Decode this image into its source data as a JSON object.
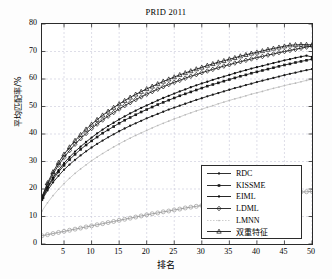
{
  "chart_data": {
    "type": "line",
    "title": "PRID 2011",
    "xlabel": "排名",
    "ylabel": "平均匹配率/%",
    "xlim": [
      1,
      50
    ],
    "ylim": [
      0,
      80
    ],
    "xticks": [
      5,
      10,
      15,
      20,
      25,
      30,
      35,
      40,
      45,
      50
    ],
    "yticks": [
      0,
      10,
      20,
      30,
      40,
      50,
      60,
      70,
      80
    ],
    "grid": true,
    "legend_position": "lower right",
    "x": [
      1,
      2,
      3,
      4,
      5,
      6,
      7,
      8,
      9,
      10,
      11,
      12,
      13,
      14,
      15,
      16,
      17,
      18,
      19,
      20,
      21,
      22,
      23,
      24,
      25,
      26,
      27,
      28,
      29,
      30,
      31,
      32,
      33,
      34,
      35,
      36,
      37,
      38,
      39,
      40,
      41,
      42,
      43,
      44,
      45,
      46,
      47,
      48,
      49,
      50
    ],
    "series": [
      {
        "name": "RDC",
        "marker": "dot",
        "color": "#1a1a1a",
        "values": [
          16.0,
          19.5,
          22.4,
          24.8,
          27.0,
          28.9,
          30.6,
          32.2,
          33.7,
          35.1,
          36.4,
          37.6,
          38.8,
          39.9,
          41.0,
          42.0,
          43.0,
          43.9,
          44.8,
          45.7,
          46.5,
          47.3,
          48.1,
          48.9,
          49.6,
          50.3,
          51.0,
          51.7,
          52.4,
          53.0,
          53.7,
          54.3,
          54.9,
          55.5,
          56.1,
          56.7,
          57.2,
          57.8,
          58.3,
          58.9,
          59.4,
          59.9,
          60.4,
          60.9,
          61.4,
          61.9,
          62.3,
          62.8,
          63.2,
          63.6
        ]
      },
      {
        "name": "KISSME",
        "marker": "square",
        "color": "#1a1a1a",
        "values": [
          16.3,
          20.3,
          23.5,
          26.2,
          28.6,
          30.7,
          32.6,
          34.4,
          36.0,
          37.5,
          38.9,
          40.3,
          41.5,
          42.7,
          43.9,
          45.0,
          46.0,
          47.0,
          48.0,
          48.9,
          49.8,
          50.7,
          51.5,
          52.3,
          53.1,
          53.9,
          54.6,
          55.3,
          56.0,
          56.7,
          57.4,
          58.0,
          58.6,
          59.2,
          59.8,
          60.4,
          61.0,
          61.5,
          62.1,
          62.6,
          63.1,
          63.6,
          64.1,
          64.6,
          65.1,
          65.5,
          66.0,
          66.4,
          66.8,
          67.2
        ]
      },
      {
        "name": "EIML",
        "marker": "dot-filled",
        "color": "#0d0d0d",
        "values": [
          16.6,
          20.8,
          24.1,
          26.9,
          29.4,
          31.6,
          33.6,
          35.4,
          37.1,
          38.7,
          40.2,
          41.6,
          42.9,
          44.1,
          45.3,
          46.4,
          47.5,
          48.5,
          49.5,
          50.4,
          51.3,
          52.2,
          53.1,
          53.9,
          54.7,
          55.5,
          56.2,
          57.0,
          57.7,
          58.4,
          59.0,
          59.7,
          60.3,
          60.9,
          61.5,
          62.1,
          62.7,
          63.2,
          63.8,
          64.3,
          64.8,
          65.3,
          65.8,
          66.3,
          66.8,
          67.2,
          67.7,
          68.1,
          68.5,
          68.0
        ]
      },
      {
        "name": "LDML",
        "marker": "diamond",
        "color": "#1a1a1a",
        "values": [
          16.8,
          21.6,
          25.4,
          28.7,
          31.5,
          34.0,
          36.3,
          38.3,
          40.2,
          42.0,
          43.6,
          45.1,
          46.5,
          47.8,
          49.1,
          50.3,
          51.4,
          52.5,
          53.5,
          54.5,
          55.4,
          56.3,
          57.2,
          58.0,
          58.8,
          59.5,
          60.3,
          61.0,
          61.6,
          62.3,
          62.9,
          63.5,
          64.1,
          64.7,
          65.2,
          65.8,
          66.3,
          66.8,
          67.3,
          67.8,
          68.2,
          68.7,
          69.1,
          69.6,
          70.0,
          70.4,
          70.8,
          71.2,
          71.6,
          72.0
        ]
      },
      {
        "name": "LMNN",
        "marker": "dot-light",
        "color": "#b9b9b9",
        "values": [
          12.0,
          15.0,
          17.6,
          19.9,
          22.0,
          23.9,
          25.7,
          27.3,
          28.8,
          30.3,
          31.6,
          32.9,
          34.1,
          35.3,
          36.4,
          37.5,
          38.5,
          39.5,
          40.4,
          41.3,
          42.2,
          43.1,
          43.9,
          44.7,
          45.5,
          46.2,
          47.0,
          47.7,
          48.4,
          49.0,
          49.7,
          50.3,
          51.0,
          51.6,
          52.2,
          52.8,
          53.3,
          53.9,
          54.5,
          55.0,
          55.5,
          56.1,
          56.6,
          57.1,
          57.6,
          58.1,
          58.5,
          59.0,
          59.5,
          59.9
        ]
      },
      {
        "name": "双重特征",
        "marker": "triangle",
        "color": "#161616",
        "values": [
          17.2,
          22.2,
          26.2,
          29.6,
          32.6,
          35.2,
          37.6,
          39.7,
          41.7,
          43.5,
          45.2,
          46.8,
          48.2,
          49.6,
          50.9,
          52.1,
          53.3,
          54.4,
          55.4,
          56.4,
          57.3,
          58.2,
          59.1,
          59.9,
          60.7,
          61.5,
          62.2,
          62.9,
          63.6,
          64.2,
          64.9,
          65.5,
          66.1,
          66.6,
          67.2,
          67.7,
          68.3,
          68.8,
          69.3,
          69.7,
          70.2,
          70.7,
          71.1,
          71.5,
          71.9,
          72.3,
          72.4,
          72.5,
          72.5,
          72.4
        ]
      },
      {
        "name": "baseline-circles",
        "marker": "circle",
        "color": "#9a9a9a",
        "values": [
          3.0,
          3.4,
          3.8,
          4.2,
          4.6,
          5.0,
          5.4,
          5.8,
          6.2,
          6.6,
          7.0,
          7.4,
          7.8,
          8.2,
          8.6,
          9.0,
          9.4,
          9.8,
          10.2,
          10.6,
          11.0,
          11.3,
          11.7,
          12.0,
          12.4,
          12.7,
          13.1,
          13.4,
          13.7,
          14.0,
          14.4,
          14.7,
          15.0,
          15.3,
          15.6,
          15.9,
          16.2,
          16.5,
          16.8,
          17.0,
          17.3,
          17.6,
          17.8,
          18.1,
          18.3,
          18.5,
          18.7,
          18.9,
          19.0,
          19.1
        ]
      }
    ]
  },
  "legend": {
    "items": [
      {
        "label": "RDC"
      },
      {
        "label": "KISSME"
      },
      {
        "label": "EIML"
      },
      {
        "label": "LDML"
      },
      {
        "label": "LMNN"
      },
      {
        "label": "双重特征"
      }
    ]
  }
}
